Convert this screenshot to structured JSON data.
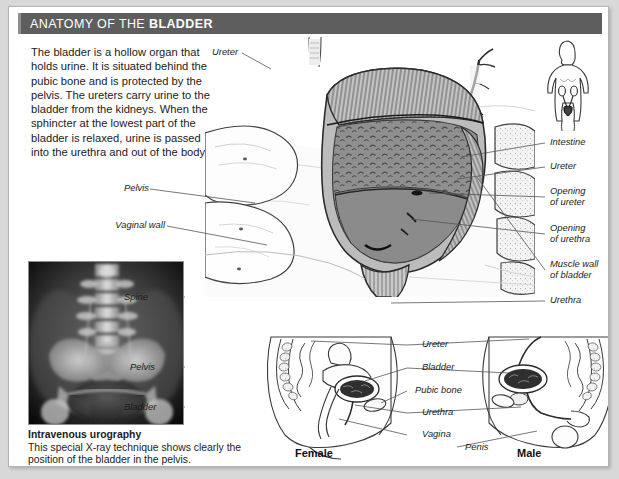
{
  "header": {
    "title_regular": "ANATOMY OF THE ",
    "title_bold": "BLADDER"
  },
  "intro": {
    "text": "The bladder is a hollow organ that holds urine. It is situated behind the pubic bone and is protected by the pelvis. The ureters carry urine to the bladder from the kidneys. When the sphincter at the lowest part of the bladder is relaxed, urine is passed into the urethra and out of the body."
  },
  "xray": {
    "caption_title": "Intravenous urography",
    "caption_text": "This special X-ray technique shows clearly the position of the bladder in the pelvis.",
    "labels": [
      {
        "text": "Spine"
      },
      {
        "text": "Pelvis"
      },
      {
        "text": "Bladder"
      }
    ]
  },
  "main_diagram": {
    "labels_left": [
      {
        "text": "Pelvis"
      },
      {
        "text": "Vaginal wall"
      }
    ],
    "labels_top": [
      {
        "text": "Ureter"
      }
    ],
    "labels_right": [
      {
        "text": "Intestine"
      },
      {
        "text": "Ureter"
      },
      {
        "text_line1": "Opening",
        "text_line2": "of ureter"
      },
      {
        "text_line1": "Opening",
        "text_line2": "of urethra"
      },
      {
        "text_line1": "Muscle wall",
        "text_line2": "of bladder"
      },
      {
        "text": "Urethra"
      }
    ]
  },
  "cross_sections": {
    "center_labels": [
      {
        "text": "Ureter"
      },
      {
        "text": "Bladder"
      },
      {
        "text": "Pubic bone"
      },
      {
        "text": "Urethra"
      },
      {
        "text": "Vagina"
      },
      {
        "text": "Penis"
      }
    ],
    "female_label": "Female",
    "male_label": "Male"
  },
  "colors": {
    "header_bg": "#5e5e5e",
    "header_accent": "#8e8e8e",
    "page_bg": "#d8d8d8",
    "card_bg": "#ffffff",
    "text": "#1b1b1b",
    "line": "#4a4a4a",
    "bladder_fill": "#8c8c8c",
    "muscle_fill": "#b9b9b9"
  }
}
